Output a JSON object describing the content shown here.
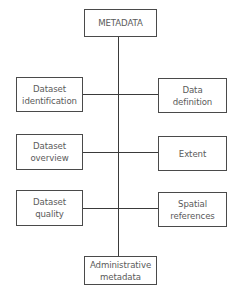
{
  "diagram": {
    "root": {
      "label": [
        "METADATA"
      ]
    },
    "left": [
      {
        "label": [
          "Dataset",
          "identification"
        ]
      },
      {
        "label": [
          "Dataset",
          "overview"
        ]
      },
      {
        "label": [
          "Dataset",
          "quality"
        ]
      }
    ],
    "right": [
      {
        "label": [
          "Data",
          "definition"
        ]
      },
      {
        "label": [
          "Extent"
        ]
      },
      {
        "label": [
          "Spatial",
          "references"
        ]
      }
    ],
    "bottom": {
      "label": [
        "Administrative",
        "metadata"
      ]
    }
  },
  "colors": {
    "line": "#3a3a3a",
    "border": "#4a4a4a",
    "text": "#5a5a5a",
    "background": "#ffffff"
  }
}
